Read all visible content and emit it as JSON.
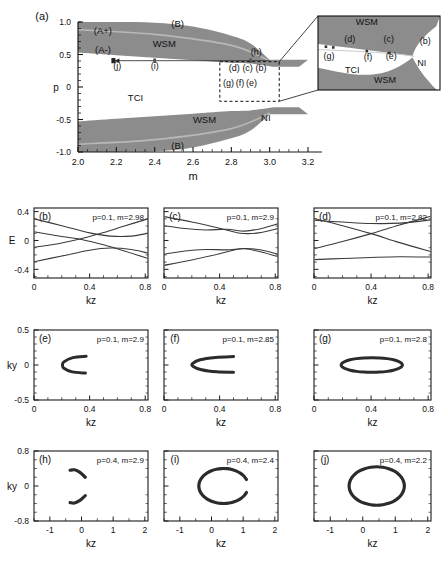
{
  "figure": {
    "panel_a": {
      "tag": "(a)",
      "xlabel": "m",
      "ylabel": "p",
      "xticks": [
        "2.0",
        "2.2",
        "2.4",
        "2.6",
        "2.8",
        "3.0",
        "3.2"
      ],
      "xtick_vals": [
        2.0,
        2.2,
        2.4,
        2.6,
        2.8,
        3.0,
        3.2
      ],
      "yticks": [
        "1.0",
        "0.5",
        "0",
        "-0.5",
        "-1.0"
      ],
      "ytick_vals": [
        1.0,
        0.5,
        0.0,
        -0.5,
        -1.0
      ],
      "xlim": [
        2.0,
        3.2
      ],
      "ylim": [
        -1.0,
        1.0
      ],
      "region_labels": [
        {
          "text": "(A+)",
          "x": 2.13,
          "y": 0.82
        },
        {
          "text": "(A-)",
          "x": 2.13,
          "y": 0.53
        },
        {
          "text": "(B)",
          "x": 2.52,
          "y": 0.93
        },
        {
          "text": "WSM",
          "x": 2.45,
          "y": 0.62
        },
        {
          "text": "TCI",
          "x": 2.3,
          "y": -0.22
        },
        {
          "text": "WSM",
          "x": 2.66,
          "y": -0.55
        },
        {
          "text": "NI",
          "x": 2.98,
          "y": -0.52
        },
        {
          "text": "(B)",
          "x": 2.52,
          "y": -0.95
        }
      ],
      "point_labels": [
        {
          "text": "(j)",
          "x": 2.205,
          "y": 0.28
        },
        {
          "text": "(i)",
          "x": 2.4,
          "y": 0.28
        },
        {
          "text": "(h)",
          "x": 2.93,
          "y": 0.5
        },
        {
          "text": "(d)",
          "x": 2.815,
          "y": 0.245
        },
        {
          "text": "(c)",
          "x": 2.885,
          "y": 0.245
        },
        {
          "text": "(b)",
          "x": 2.955,
          "y": 0.245
        },
        {
          "text": "(g)",
          "x": 2.785,
          "y": 0.02
        },
        {
          "text": "(f)",
          "x": 2.845,
          "y": 0.02
        },
        {
          "text": "(e)",
          "x": 2.905,
          "y": 0.02
        }
      ],
      "zoom_box": {
        "x0": 2.74,
        "x1": 3.05,
        "y0": -0.22,
        "y1": 0.39
      },
      "inset": {
        "labels": [
          {
            "text": "WSM",
            "x": 0.4,
            "y": 0.88
          },
          {
            "text": "(d)",
            "x": 0.26,
            "y": 0.65
          },
          {
            "text": "(c)",
            "x": 0.58,
            "y": 0.65
          },
          {
            "text": "(b)",
            "x": 0.88,
            "y": 0.62
          },
          {
            "text": "(g)",
            "x": 0.09,
            "y": 0.42
          },
          {
            "text": "(f)",
            "x": 0.41,
            "y": 0.41
          },
          {
            "text": "(e)",
            "x": 0.6,
            "y": 0.42
          },
          {
            "text": "NI",
            "x": 0.85,
            "y": 0.32
          },
          {
            "text": "TCI",
            "x": 0.28,
            "y": 0.23
          },
          {
            "text": "WSM",
            "x": 0.55,
            "y": 0.09
          }
        ]
      }
    },
    "panel_b": {
      "tag": "(b)",
      "annotation": "p=0.1, m=2.98",
      "xlabel": "kz",
      "ylabel": "E",
      "xticks": [
        "0",
        "0.4",
        "0.8"
      ],
      "yticks": [
        "0.4",
        "0",
        "-0.4"
      ],
      "xlim": [
        0,
        0.82
      ],
      "ylim": [
        -0.52,
        0.45
      ]
    },
    "panel_c": {
      "tag": "(c)",
      "annotation": "p=0.1, m=2.9",
      "xlabel": "kz",
      "xticks": [
        "0",
        "0.4",
        "0.8"
      ],
      "xlim": [
        0,
        0.82
      ],
      "ylim": [
        -0.52,
        0.45
      ]
    },
    "panel_d": {
      "tag": "(d)",
      "annotation": "p=0.1, m=2.82",
      "xlabel": "kz",
      "xticks": [
        "0",
        "0.4",
        "0.8"
      ],
      "xlim": [
        0,
        0.82
      ],
      "ylim": [
        -0.52,
        0.45
      ]
    },
    "panel_e": {
      "tag": "(e)",
      "annotation": "p=0.1, m=2.9",
      "xlabel": "kz",
      "ylabel": "ky",
      "xticks": [
        "0",
        "0.4",
        "0.8"
      ],
      "yticks": [
        "0.5",
        "0",
        "-0.5"
      ],
      "xlim": [
        0,
        0.82
      ],
      "ylim": [
        -0.5,
        0.5
      ]
    },
    "panel_f": {
      "tag": "(f)",
      "annotation": "p=0.1, m=2.85",
      "xlabel": "kz",
      "xticks": [
        "0",
        "0.4",
        "0.8"
      ],
      "xlim": [
        0,
        0.82
      ],
      "ylim": [
        -0.5,
        0.5
      ]
    },
    "panel_g": {
      "tag": "(g)",
      "annotation": "p=0.1, m=2.8",
      "xlabel": "kz",
      "xticks": [
        "0",
        "0.4",
        "0.8"
      ],
      "xlim": [
        0,
        0.82
      ],
      "ylim": [
        -0.5,
        0.5
      ]
    },
    "panel_h": {
      "tag": "(h)",
      "annotation": "p=0.4, m=2.9",
      "xlabel": "kz",
      "ylabel": "ky",
      "xticks": [
        "-1",
        "0",
        "1",
        "2"
      ],
      "yticks": [
        "0.8",
        "0",
        "-0.8"
      ],
      "xlim": [
        -1.5,
        2.1
      ],
      "ylim": [
        -0.8,
        0.8
      ]
    },
    "panel_i": {
      "tag": "(i)",
      "annotation": "p=0.4, m=2.4",
      "xlabel": "kz",
      "xticks": [
        "-1",
        "0",
        "1",
        "2"
      ],
      "xlim": [
        -1.5,
        2.1
      ],
      "ylim": [
        -0.8,
        0.8
      ]
    },
    "panel_j": {
      "tag": "(j)",
      "annotation": "p=0.4, m=2.2",
      "xlabel": "kz",
      "xticks": [
        "-1",
        "0",
        "1",
        "2"
      ],
      "xlim": [
        -1.5,
        2.1
      ],
      "ylim": [
        -0.8,
        0.8
      ]
    }
  },
  "chart_data": {
    "type": "line",
    "title": "",
    "panels": [
      {
        "id": "a",
        "type": "phase-diagram",
        "xlabel": "m",
        "ylabel": "p",
        "xlim": [
          2.0,
          3.2
        ],
        "ylim": [
          -1.0,
          1.0
        ],
        "phases": [
          "WSM",
          "TCI",
          "NI",
          "(A+)",
          "(A-)",
          "(B)"
        ],
        "boundaries": {
          "upper_band_top": [
            [
              2.0,
              1.0
            ],
            [
              2.2,
              1.0
            ],
            [
              2.4,
              0.99
            ],
            [
              2.6,
              0.93
            ],
            [
              2.8,
              0.79
            ],
            [
              2.9,
              0.67
            ],
            [
              3.0,
              0.42
            ]
          ],
          "upper_band_bottom": [
            [
              2.0,
              0.53
            ],
            [
              2.2,
              0.49
            ],
            [
              2.4,
              0.45
            ],
            [
              2.6,
              0.41
            ],
            [
              2.8,
              0.37
            ],
            [
              2.9,
              0.36
            ],
            [
              3.02,
              0.31
            ]
          ],
          "lower_band_top": [
            [
              2.0,
              -0.53
            ],
            [
              2.2,
              -0.49
            ],
            [
              2.4,
              -0.45
            ],
            [
              2.6,
              -0.41
            ],
            [
              2.8,
              -0.37
            ],
            [
              2.9,
              -0.36
            ],
            [
              3.02,
              -0.31
            ]
          ],
          "lower_band_bottom": [
            [
              2.0,
              -1.0
            ],
            [
              2.2,
              -1.0
            ],
            [
              2.4,
              -0.99
            ],
            [
              2.6,
              -0.93
            ],
            [
              2.8,
              -0.79
            ],
            [
              2.9,
              -0.67
            ],
            [
              3.0,
              -0.42
            ]
          ],
          "A_line_upper": [
            [
              2.0,
              0.88
            ],
            [
              2.4,
              0.81
            ],
            [
              2.8,
              0.64
            ],
            [
              3.0,
              0.4
            ]
          ],
          "A_line_lower": [
            [
              2.0,
              -0.88
            ],
            [
              2.4,
              -0.81
            ],
            [
              2.8,
              -0.64
            ],
            [
              3.0,
              -0.4
            ]
          ]
        },
        "markers_line_p": 0.4,
        "marked_points": [
          {
            "label": "(j)",
            "m": 2.2,
            "p": 0.4
          },
          {
            "label": "(i)",
            "m": 2.4,
            "p": 0.4
          },
          {
            "label": "(h)",
            "m": 2.9,
            "p": 0.4
          },
          {
            "label": "(b)",
            "m": 2.98,
            "p": 0.1
          },
          {
            "label": "(c)",
            "m": 2.9,
            "p": 0.1
          },
          {
            "label": "(d)",
            "m": 2.82,
            "p": 0.1
          },
          {
            "label": "(e)",
            "m": 2.9,
            "p": 0.1
          },
          {
            "label": "(f)",
            "m": 2.85,
            "p": 0.1
          },
          {
            "label": "(g)",
            "m": 2.8,
            "p": 0.1
          }
        ]
      },
      {
        "id": "b",
        "type": "line",
        "xlabel": "kz",
        "ylabel": "E",
        "xlim": [
          0,
          0.82
        ],
        "ylim": [
          -0.52,
          0.45
        ],
        "annotation": "p=0.1, m=2.98",
        "n_bands": 4
      },
      {
        "id": "c",
        "type": "line",
        "xlabel": "kz",
        "ylabel": "E",
        "xlim": [
          0,
          0.82
        ],
        "ylim": [
          -0.52,
          0.45
        ],
        "annotation": "p=0.1, m=2.9",
        "n_bands": 4
      },
      {
        "id": "d",
        "type": "line",
        "xlabel": "kz",
        "ylabel": "E",
        "xlim": [
          0,
          0.82
        ],
        "ylim": [
          -0.52,
          0.45
        ],
        "annotation": "p=0.1, m=2.82",
        "n_bands": 4
      },
      {
        "id": "e",
        "type": "contour",
        "xlabel": "kz",
        "ylabel": "ky",
        "xlim": [
          0,
          0.82
        ],
        "ylim": [
          -0.5,
          0.5
        ],
        "annotation": "p=0.1, m=2.9",
        "shape": "open-arc-small"
      },
      {
        "id": "f",
        "type": "contour",
        "xlabel": "kz",
        "ylabel": "ky",
        "xlim": [
          0,
          0.82
        ],
        "ylim": [
          -0.5,
          0.5
        ],
        "annotation": "p=0.1, m=2.85",
        "shape": "open-arc-medium"
      },
      {
        "id": "g",
        "type": "contour",
        "xlabel": "kz",
        "ylabel": "ky",
        "xlim": [
          0,
          0.82
        ],
        "ylim": [
          -0.5,
          0.5
        ],
        "annotation": "p=0.1, m=2.8",
        "shape": "closed-ellipse"
      },
      {
        "id": "h",
        "type": "contour",
        "xlabel": "kz",
        "ylabel": "ky",
        "xlim": [
          -1.5,
          2.1
        ],
        "ylim": [
          -0.8,
          0.8
        ],
        "annotation": "p=0.4, m=2.9",
        "shape": "two-arcs"
      },
      {
        "id": "i",
        "type": "contour",
        "xlabel": "kz",
        "ylabel": "ky",
        "xlim": [
          -1.5,
          2.1
        ],
        "ylim": [
          -0.8,
          0.8
        ],
        "annotation": "p=0.4, m=2.4",
        "shape": "open-ellipse"
      },
      {
        "id": "j",
        "type": "contour",
        "xlabel": "kz",
        "ylabel": "ky",
        "xlim": [
          -1.5,
          2.1
        ],
        "ylim": [
          -0.8,
          0.8
        ],
        "annotation": "p=0.4, m=2.2",
        "shape": "closed-ellipse"
      }
    ]
  },
  "colors": {
    "band_gray": "#8c8c8c",
    "band_line": "#b8b8b8",
    "axis": "#1a1a1a",
    "curve": "#333333",
    "background": "#ffffff"
  }
}
